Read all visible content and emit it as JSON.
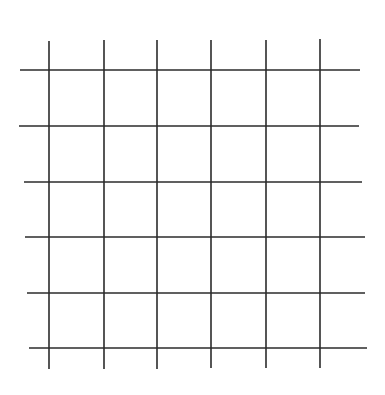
{
  "diagram": {
    "type": "grid",
    "line_color": "#2b2b2b",
    "line_width": 1.6,
    "background": "#ffffff",
    "vertical_lines": [
      {
        "x1": 49,
        "y1": 41,
        "x2": 49,
        "y2": 369
      },
      {
        "x1": 104,
        "y1": 40,
        "x2": 104,
        "y2": 369
      },
      {
        "x1": 157,
        "y1": 40,
        "x2": 157,
        "y2": 369
      },
      {
        "x1": 211,
        "y1": 40,
        "x2": 211,
        "y2": 368
      },
      {
        "x1": 266,
        "y1": 40,
        "x2": 266,
        "y2": 368
      },
      {
        "x1": 320,
        "y1": 39,
        "x2": 320,
        "y2": 368
      }
    ],
    "horizontal_lines": [
      {
        "x1": 20,
        "y1": 70,
        "x2": 360,
        "y2": 70
      },
      {
        "x1": 19,
        "y1": 126,
        "x2": 359,
        "y2": 126
      },
      {
        "x1": 24,
        "y1": 182,
        "x2": 362,
        "y2": 182
      },
      {
        "x1": 25,
        "y1": 237,
        "x2": 365,
        "y2": 237
      },
      {
        "x1": 27,
        "y1": 293,
        "x2": 365,
        "y2": 293
      },
      {
        "x1": 29,
        "y1": 348,
        "x2": 367,
        "y2": 348
      }
    ]
  }
}
